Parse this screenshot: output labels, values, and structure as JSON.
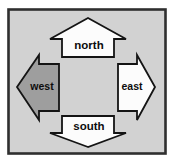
{
  "palette": {
    "page_bg": "#ffffff",
    "panel_bg": "#d2d2d2",
    "panel_border": "#2f2f2f",
    "arrow_fill": "#fcfcfc",
    "arrow_active_fill": "#9e9e9e",
    "arrow_stroke": "#141414",
    "label_color": "#0d0d0d"
  },
  "compass": {
    "directions": [
      {
        "id": "north",
        "label": "north",
        "active": false
      },
      {
        "id": "east",
        "label": "east",
        "active": false
      },
      {
        "id": "south",
        "label": "south",
        "active": false
      },
      {
        "id": "west",
        "label": "west",
        "active": true
      }
    ]
  }
}
